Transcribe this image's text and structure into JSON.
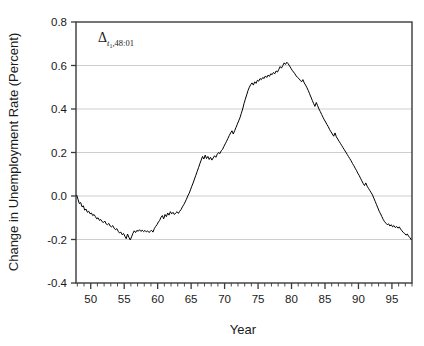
{
  "chart_data": {
    "type": "line",
    "title": "",
    "xlabel": "Year",
    "ylabel": "Change in Unemployment Rate (Percent)",
    "annotation": "Δ",
    "annotation_sub": "t",
    "annotation_sub_idx": "1",
    "annotation_sub_rest": ",48:01",
    "xlim": [
      1947.8,
      1998.0
    ],
    "ylim": [
      -0.4,
      0.8
    ],
    "yticks": [
      "0.8",
      "0.6",
      "0.4",
      "0.2",
      "0.0",
      "-0.2",
      "-0.4"
    ],
    "ytick_values": [
      0.8,
      0.6,
      0.4,
      0.2,
      0.0,
      -0.2,
      -0.4
    ],
    "xticks": [
      "50",
      "55",
      "60",
      "65",
      "70",
      "75",
      "80",
      "85",
      "90",
      "95"
    ],
    "xtick_values": [
      1950,
      1955,
      1960,
      1965,
      1970,
      1975,
      1980,
      1985,
      1990,
      1995
    ],
    "x_minor_step": 1,
    "grid": "horizontal",
    "grid_color": "#b9b9b9",
    "line_color": "#000000",
    "line_width": 1.0,
    "frame_color": "#3a3a3a",
    "background": "#ffffff",
    "series": [
      {
        "name": "Change in Unemployment Rate",
        "x": [
          1947.9,
          1948.1,
          1948.3,
          1948.5,
          1948.7,
          1948.9,
          1949.1,
          1949.3,
          1949.5,
          1949.7,
          1949.9,
          1950.1,
          1950.3,
          1950.5,
          1950.7,
          1950.9,
          1951.1,
          1951.3,
          1951.5,
          1951.7,
          1951.9,
          1952.1,
          1952.3,
          1952.5,
          1952.7,
          1952.9,
          1953.1,
          1953.3,
          1953.5,
          1953.7,
          1953.9,
          1954.1,
          1954.3,
          1954.5,
          1954.7,
          1954.9,
          1955.1,
          1955.3,
          1955.5,
          1955.7,
          1955.9,
          1956.1,
          1956.3,
          1956.5,
          1956.7,
          1956.9,
          1957.1,
          1957.3,
          1957.5,
          1957.7,
          1957.9,
          1958.1,
          1958.3,
          1958.5,
          1958.7,
          1958.9,
          1959.1,
          1959.3,
          1959.5,
          1959.7,
          1959.9,
          1960.1,
          1960.3,
          1960.5,
          1960.7,
          1960.9,
          1961.1,
          1961.3,
          1961.5,
          1961.7,
          1961.9,
          1962.1,
          1962.3,
          1962.5,
          1962.7,
          1962.9,
          1963.1,
          1963.3,
          1963.5,
          1963.7,
          1963.9,
          1964.1,
          1964.3,
          1964.5,
          1964.7,
          1964.9,
          1965.1,
          1965.3,
          1965.5,
          1965.7,
          1965.9,
          1966.1,
          1966.3,
          1966.5,
          1966.7,
          1966.9,
          1967.1,
          1967.3,
          1967.5,
          1967.7,
          1967.9,
          1968.1,
          1968.3,
          1968.5,
          1968.7,
          1968.9,
          1969.1,
          1969.3,
          1969.5,
          1969.7,
          1969.9,
          1970.1,
          1970.3,
          1970.5,
          1970.7,
          1970.9,
          1971.1,
          1971.3,
          1971.5,
          1971.7,
          1971.9,
          1972.1,
          1972.3,
          1972.5,
          1972.7,
          1972.9,
          1973.1,
          1973.3,
          1973.5,
          1973.7,
          1973.9,
          1974.1,
          1974.3,
          1974.5,
          1974.7,
          1974.9,
          1975.1,
          1975.3,
          1975.5,
          1975.7,
          1975.9,
          1976.1,
          1976.3,
          1976.5,
          1976.7,
          1976.9,
          1977.1,
          1977.3,
          1977.5,
          1977.7,
          1977.9,
          1978.1,
          1978.3,
          1978.5,
          1978.7,
          1978.9,
          1979.1,
          1979.3,
          1979.5,
          1979.7,
          1979.9,
          1980.1,
          1980.3,
          1980.5,
          1980.7,
          1980.9,
          1981.1,
          1981.3,
          1981.5,
          1981.7,
          1981.9,
          1982.1,
          1982.3,
          1982.5,
          1982.7,
          1982.9,
          1983.1,
          1983.3,
          1983.5,
          1983.7,
          1983.9,
          1984.1,
          1984.3,
          1984.5,
          1984.7,
          1984.9,
          1985.1,
          1985.3,
          1985.5,
          1985.7,
          1985.9,
          1986.1,
          1986.3,
          1986.5,
          1986.7,
          1986.9,
          1987.1,
          1987.3,
          1987.5,
          1987.7,
          1987.9,
          1988.1,
          1988.3,
          1988.5,
          1988.7,
          1988.9,
          1989.1,
          1989.3,
          1989.5,
          1989.7,
          1989.9,
          1990.1,
          1990.3,
          1990.5,
          1990.7,
          1990.9,
          1991.1,
          1991.3,
          1991.5,
          1991.7,
          1991.9,
          1992.1,
          1992.3,
          1992.5,
          1992.7,
          1992.9,
          1993.1,
          1993.3,
          1993.5,
          1993.7,
          1993.9,
          1994.1,
          1994.3,
          1994.5,
          1994.7,
          1994.9,
          1995.1,
          1995.3,
          1995.5,
          1995.7,
          1995.9,
          1996.1,
          1996.3,
          1996.5,
          1996.7,
          1996.9,
          1997.1,
          1997.3,
          1997.5,
          1997.7,
          1997.9
        ],
        "y": [
          0.005,
          -0.015,
          -0.035,
          -0.03,
          -0.05,
          -0.045,
          -0.065,
          -0.06,
          -0.075,
          -0.07,
          -0.082,
          -0.078,
          -0.09,
          -0.085,
          -0.095,
          -0.105,
          -0.1,
          -0.112,
          -0.108,
          -0.118,
          -0.122,
          -0.115,
          -0.128,
          -0.132,
          -0.126,
          -0.138,
          -0.142,
          -0.136,
          -0.148,
          -0.155,
          -0.15,
          -0.162,
          -0.17,
          -0.166,
          -0.178,
          -0.172,
          -0.185,
          -0.196,
          -0.175,
          -0.19,
          -0.202,
          -0.188,
          -0.172,
          -0.16,
          -0.168,
          -0.158,
          -0.162,
          -0.155,
          -0.163,
          -0.157,
          -0.164,
          -0.158,
          -0.165,
          -0.16,
          -0.168,
          -0.162,
          -0.158,
          -0.166,
          -0.15,
          -0.14,
          -0.132,
          -0.12,
          -0.112,
          -0.098,
          -0.09,
          -0.105,
          -0.085,
          -0.095,
          -0.078,
          -0.088,
          -0.072,
          -0.082,
          -0.075,
          -0.085,
          -0.078,
          -0.072,
          -0.08,
          -0.07,
          -0.062,
          -0.05,
          -0.04,
          -0.028,
          -0.015,
          0.0,
          0.012,
          0.028,
          0.045,
          0.06,
          0.078,
          0.095,
          0.112,
          0.13,
          0.148,
          0.165,
          0.182,
          0.17,
          0.188,
          0.172,
          0.182,
          0.168,
          0.178,
          0.165,
          0.175,
          0.185,
          0.178,
          0.192,
          0.2,
          0.195,
          0.208,
          0.215,
          0.228,
          0.24,
          0.252,
          0.265,
          0.278,
          0.29,
          0.3,
          0.285,
          0.3,
          0.315,
          0.33,
          0.345,
          0.36,
          0.38,
          0.4,
          0.425,
          0.445,
          0.465,
          0.485,
          0.5,
          0.512,
          0.52,
          0.51,
          0.525,
          0.518,
          0.532,
          0.528,
          0.54,
          0.535,
          0.545,
          0.54,
          0.552,
          0.545,
          0.556,
          0.55,
          0.562,
          0.558,
          0.568,
          0.562,
          0.575,
          0.57,
          0.582,
          0.595,
          0.588,
          0.6,
          0.612,
          0.605,
          0.615,
          0.608,
          0.598,
          0.588,
          0.578,
          0.57,
          0.562,
          0.552,
          0.545,
          0.54,
          0.532,
          0.525,
          0.535,
          0.52,
          0.51,
          0.498,
          0.485,
          0.47,
          0.455,
          0.44,
          0.425,
          0.412,
          0.43,
          0.415,
          0.4,
          0.388,
          0.375,
          0.362,
          0.35,
          0.34,
          0.328,
          0.318,
          0.305,
          0.295,
          0.285,
          0.275,
          0.29,
          0.272,
          0.262,
          0.252,
          0.242,
          0.232,
          0.222,
          0.212,
          0.202,
          0.192,
          0.182,
          0.172,
          0.162,
          0.15,
          0.14,
          0.128,
          0.118,
          0.105,
          0.095,
          0.082,
          0.07,
          0.058,
          0.048,
          0.06,
          0.045,
          0.035,
          0.025,
          0.015,
          0.005,
          -0.01,
          -0.025,
          -0.04,
          -0.055,
          -0.07,
          -0.082,
          -0.095,
          -0.108,
          -0.118,
          -0.125,
          -0.132,
          -0.128,
          -0.138,
          -0.132,
          -0.142,
          -0.136,
          -0.145,
          -0.14,
          -0.148,
          -0.142,
          -0.152,
          -0.16,
          -0.168,
          -0.172,
          -0.18,
          -0.175,
          -0.185,
          -0.192,
          -0.202
        ]
      }
    ]
  },
  "figure": {
    "xlabel": "Year",
    "ylabel": "Change in Unemployment Rate (Percent)"
  }
}
